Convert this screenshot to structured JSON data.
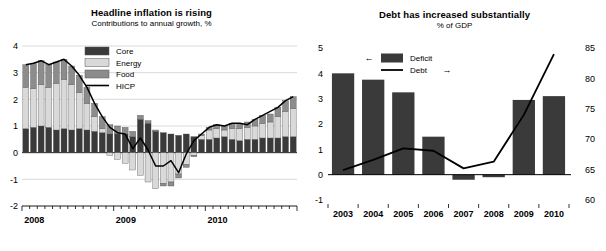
{
  "charts": [
    {
      "id": "inflation",
      "title": "Headline inflation is rising",
      "subtitle": "Contributions to annual growth, %",
      "legend": [
        {
          "label": "Core",
          "type": "swatch",
          "color": "#3a3a3a"
        },
        {
          "label": "Energy",
          "type": "swatch",
          "color": "#d9d9d9"
        },
        {
          "label": "Food",
          "type": "swatch",
          "color": "#8c8c8c"
        },
        {
          "label": "HICP",
          "type": "line",
          "color": "#000000"
        }
      ],
      "chart_data": {
        "type": "bar",
        "title": "Headline inflation is rising",
        "subtitle": "Contributions to annual growth, %",
        "xlabel": "",
        "ylabel": "",
        "ylim": [
          -2,
          4
        ],
        "yticks": [
          4,
          3,
          2,
          1,
          0,
          -1,
          -2
        ],
        "ytick_labels": [
          "4",
          "3",
          "2",
          "1",
          "0",
          "-1",
          "-2"
        ],
        "grid": true,
        "legend_position": "top-center",
        "stacked": true,
        "tick_labels": [
          "2008",
          "2009",
          "2010"
        ],
        "tick_label_positions": [
          0,
          12,
          24
        ],
        "categories": [
          "2008-01",
          "2008-02",
          "2008-03",
          "2008-04",
          "2008-05",
          "2008-06",
          "2008-07",
          "2008-08",
          "2008-09",
          "2008-10",
          "2008-11",
          "2008-12",
          "2009-01",
          "2009-02",
          "2009-03",
          "2009-04",
          "2009-05",
          "2009-06",
          "2009-07",
          "2009-08",
          "2009-09",
          "2009-10",
          "2009-11",
          "2009-12",
          "2010-01",
          "2010-02",
          "2010-03",
          "2010-04",
          "2010-05",
          "2010-06",
          "2010-07",
          "2010-08",
          "2010-09",
          "2010-10",
          "2010-11",
          "2010-12"
        ],
        "series": [
          {
            "name": "Core",
            "color": "#3a3a3a",
            "values": [
              0.9,
              0.95,
              1.0,
              0.95,
              0.85,
              0.9,
              0.85,
              0.9,
              0.85,
              0.8,
              0.75,
              0.7,
              0.7,
              0.7,
              0.6,
              1.25,
              1.1,
              0.8,
              0.75,
              0.7,
              0.65,
              0.7,
              0.6,
              0.5,
              0.5,
              0.55,
              0.6,
              0.5,
              0.45,
              0.5,
              0.5,
              0.55,
              0.55,
              0.55,
              0.6,
              0.6
            ]
          },
          {
            "name": "Energy",
            "color": "#d9d9d9",
            "values": [
              1.55,
              1.45,
              1.55,
              1.5,
              1.75,
              1.85,
              1.7,
              1.35,
              1.0,
              0.55,
              0.15,
              -0.1,
              -0.25,
              -0.4,
              -0.65,
              -0.85,
              -1.1,
              -1.35,
              -1.15,
              -1.1,
              -0.8,
              -0.45,
              -0.1,
              0.15,
              0.35,
              0.35,
              0.25,
              0.4,
              0.45,
              0.45,
              0.5,
              0.55,
              0.6,
              0.8,
              0.95,
              1.05
            ]
          },
          {
            "name": "Food",
            "color": "#8c8c8c",
            "values": [
              0.85,
              0.95,
              0.9,
              0.85,
              0.8,
              0.75,
              0.7,
              0.65,
              0.6,
              0.5,
              0.45,
              0.35,
              0.3,
              0.25,
              0.2,
              0.15,
              0.1,
              0.05,
              -0.1,
              -0.15,
              -0.15,
              -0.1,
              -0.05,
              0.05,
              0.1,
              0.15,
              0.15,
              0.2,
              0.2,
              0.2,
              0.25,
              0.3,
              0.3,
              0.35,
              0.4,
              0.45
            ]
          }
        ],
        "line_series": {
          "name": "HICP",
          "color": "#000000",
          "values": [
            3.3,
            3.35,
            3.45,
            3.3,
            3.4,
            3.5,
            3.25,
            2.9,
            2.45,
            1.85,
            1.35,
            0.95,
            0.75,
            0.7,
            0.15,
            0.55,
            0.1,
            -0.5,
            -0.5,
            -0.3,
            -0.75,
            -0.05,
            0.45,
            0.7,
            0.95,
            1.05,
            1.0,
            1.1,
            1.1,
            1.05,
            1.25,
            1.4,
            1.55,
            1.7,
            1.95,
            2.1
          ]
        }
      }
    },
    {
      "id": "debt",
      "title": "Debt has increased substantially",
      "subtitle": "% of GDP",
      "legend": [
        {
          "label": "Deficit",
          "type": "swatch",
          "color": "#3a3a3a",
          "arrow": "←",
          "arrow_side": "left"
        },
        {
          "label": "Debt",
          "type": "line",
          "color": "#000000",
          "arrow": "→",
          "arrow_side": "right"
        }
      ],
      "chart_data": {
        "type": "bar",
        "title": "Debt has increased substantially",
        "subtitle": "% of GDP",
        "xlabel": "",
        "ylabel": "",
        "grid": false,
        "legend_position": "top-left",
        "categories": [
          "2003",
          "2004",
          "2005",
          "2006",
          "2007",
          "2008",
          "2009",
          "2010"
        ],
        "left_axis": {
          "name": "Deficit",
          "ylim": [
            -1,
            5
          ],
          "yticks": [
            5,
            4,
            3,
            2,
            1,
            0,
            -1
          ],
          "ytick_labels": [
            "5",
            "4",
            "3",
            "2",
            "1",
            "0",
            "-1"
          ]
        },
        "right_axis": {
          "name": "Debt",
          "ylim": [
            60,
            85
          ],
          "yticks": [
            85,
            80,
            75,
            70,
            65,
            60
          ],
          "ytick_labels": [
            "85",
            "80",
            "75",
            "70",
            "65",
            "60"
          ]
        },
        "series": [
          {
            "name": "Deficit",
            "axis": "left",
            "color": "#3a3a3a",
            "values": [
              4.0,
              3.75,
              3.25,
              1.5,
              -0.2,
              -0.1,
              2.95,
              3.1
            ]
          }
        ],
        "line_series": {
          "name": "Debt",
          "axis": "right",
          "color": "#000000",
          "values": [
            64.9,
            66.6,
            68.5,
            68.1,
            65.2,
            66.3,
            74.0,
            84.0
          ]
        }
      }
    }
  ]
}
